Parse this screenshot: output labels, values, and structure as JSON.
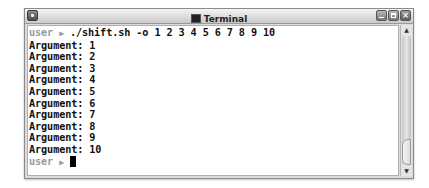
{
  "window": {
    "title": "Terminal",
    "controls": {
      "minimize": "minimize",
      "maximize": "maximize",
      "close": "×"
    }
  },
  "terminal": {
    "prompt_user": "user",
    "prompt_arrow": "▶",
    "command": " ./shift.sh -o 1 2 3 4 5 6 7 8 9 10",
    "output": [
      "Argument: 1",
      "Argument: 2",
      "Argument: 3",
      "Argument: 4",
      "Argument: 5",
      "Argument: 6",
      "Argument: 7",
      "Argument: 8",
      "Argument: 9",
      "Argument: 10"
    ]
  },
  "scrollbar": {
    "up": "▲",
    "down": "▼"
  }
}
